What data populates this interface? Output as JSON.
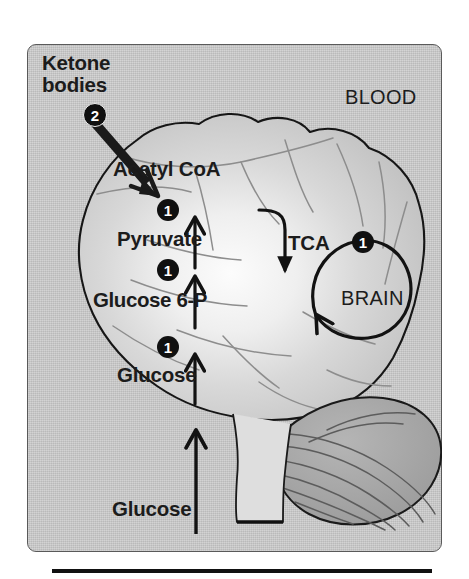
{
  "figure": {
    "domain_label": "brain-glucose-and-ketone-metabolism-diagram",
    "compartments": {
      "outside_label": "BLOOD",
      "inside_label": "BRAIN"
    },
    "metabolites": {
      "blood_glucose": "Glucose",
      "ketone_bodies": "Ketone\nbodies",
      "ketone_bodies_line1": "Ketone",
      "ketone_bodies_line2": "bodies",
      "brain_glucose": "Glucose",
      "glucose_6_phosphate": "Glucose 6-P",
      "pyruvate": "Pyruvate",
      "acetyl_coa": "Acetyl CoA",
      "tca_cycle": "TCA"
    },
    "step_badges": {
      "glucose_to_g6p": "1",
      "g6p_to_pyruvate": "1",
      "pyruvate_to_acetyl_coa": "1",
      "tca_cycle_step": "1",
      "ketone_bodies_to_acetyl_coa": "2"
    },
    "colors": {
      "panel_background": "#c8c8c8",
      "panel_border": "#5a5a5a",
      "brain_fill": "#cfcfcf",
      "brain_highlight": "#fbfbfb",
      "cerebellum_fill": "#a6a6a6",
      "outline": "#1a1a1a",
      "text": "#1c1c1c",
      "badge_fill": "#101010",
      "badge_text": "#ffffff",
      "page_background": "#ffffff"
    }
  }
}
